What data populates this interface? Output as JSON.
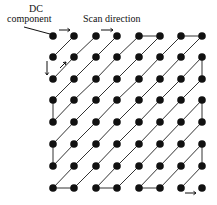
{
  "labels": {
    "dc_line1": "DC",
    "dc_line2": "component",
    "scan_direction": "Scan direction"
  },
  "grid": {
    "rows": 8,
    "cols": 8,
    "x": [
      53,
      74,
      96,
      117,
      139,
      160,
      181,
      202
    ],
    "y": [
      36,
      57,
      79,
      100,
      122,
      144,
      166,
      188
    ]
  },
  "scan_type": "zigzag",
  "colors": {
    "dot": "#111111",
    "line": "#333333"
  }
}
